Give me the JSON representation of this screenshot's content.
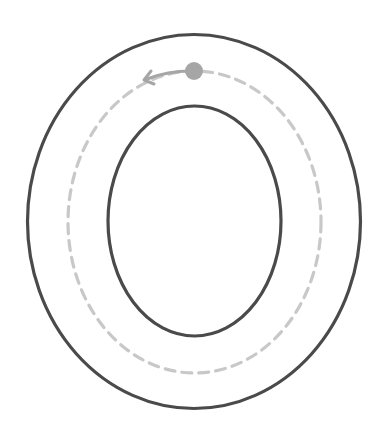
{
  "worksheet": {
    "letter": "O",
    "outer_stroke_color": "#4a4a4a",
    "inner_stroke_color": "#4a4a4a",
    "guide_color": "#c8c8c8",
    "start_dot_color": "#a6a6a6",
    "arrow_color": "#a6a6a6",
    "direction": "counter-clockwise"
  }
}
